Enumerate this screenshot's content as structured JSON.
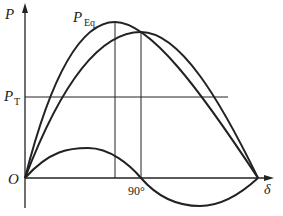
{
  "diagram": {
    "type": "power-angle characteristic",
    "labels": {
      "y_axis": "P",
      "x_axis": "δ",
      "origin": "O",
      "peq_main": "P",
      "peq_sub": "Eq",
      "pt_main": "P",
      "pt_sub": "T",
      "tick_90": "90°"
    },
    "curves": [
      {
        "name": "P_Eq",
        "description": "basic sinusoidal power curve, peak at 90°"
      },
      {
        "name": "P_total",
        "description": "resultant power curve, peak beyond 90°"
      },
      {
        "name": "reluctance",
        "description": "second-harmonic component, positive then negative"
      }
    ],
    "reference_lines": [
      {
        "name": "P_T",
        "type": "horizontal"
      },
      {
        "name": "90°",
        "type": "vertical"
      },
      {
        "name": "peak_of_total",
        "type": "vertical"
      }
    ],
    "colors": {
      "line": "#222222",
      "background": "#ffffff"
    }
  }
}
